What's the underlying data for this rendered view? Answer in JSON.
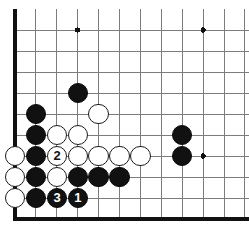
{
  "diagram": {
    "board": {
      "kind": "go-board",
      "orientation": "lower-left-corner",
      "grid_cols": 11,
      "grid_rows": 10,
      "origin_x": 15,
      "origin_y_bottom": 219,
      "spacing_x": 20.9,
      "spacing_y": 21.0,
      "stone_radius": 10.2,
      "line_color": "#7c7c7c",
      "edge_color": "#111111",
      "edge_width": 3.2,
      "line_width": 1.0,
      "background_color": "#ffffff",
      "black_color": "#111111",
      "white_color": "#ffffff",
      "white_outline_color": "#1a1a1a",
      "star_points": [
        {
          "col": 4,
          "row": 10
        },
        {
          "col": 10,
          "row": 10
        },
        {
          "col": 10,
          "row": 4
        }
      ]
    },
    "stones": [
      {
        "id": "b-c4r7",
        "color": "black",
        "col": 4,
        "row": 7,
        "label": ""
      },
      {
        "id": "b-c2r6",
        "color": "black",
        "col": 2,
        "row": 6,
        "label": ""
      },
      {
        "id": "b-c2r5",
        "color": "black",
        "col": 2,
        "row": 5,
        "label": ""
      },
      {
        "id": "w-c5r6",
        "color": "white",
        "col": 5,
        "row": 6,
        "label": ""
      },
      {
        "id": "w-c3r5",
        "color": "white",
        "col": 3,
        "row": 5,
        "label": ""
      },
      {
        "id": "w-c4r5",
        "color": "white",
        "col": 4,
        "row": 5,
        "label": ""
      },
      {
        "id": "b-c9r5",
        "color": "black",
        "col": 9,
        "row": 5,
        "label": ""
      },
      {
        "id": "w-c1r4",
        "color": "white",
        "col": 1,
        "row": 4,
        "label": ""
      },
      {
        "id": "b-c2r4",
        "color": "black",
        "col": 2,
        "row": 4,
        "label": ""
      },
      {
        "id": "w-c3r4",
        "color": "white",
        "col": 3,
        "row": 4,
        "label": "2"
      },
      {
        "id": "w-c4r4",
        "color": "white",
        "col": 4,
        "row": 4,
        "label": ""
      },
      {
        "id": "w-c5r4",
        "color": "white",
        "col": 5,
        "row": 4,
        "label": ""
      },
      {
        "id": "w-c6r4",
        "color": "white",
        "col": 6,
        "row": 4,
        "label": ""
      },
      {
        "id": "w-c7r4",
        "color": "white",
        "col": 7,
        "row": 4,
        "label": ""
      },
      {
        "id": "b-c9r4",
        "color": "black",
        "col": 9,
        "row": 4,
        "label": ""
      },
      {
        "id": "w-c1r3",
        "color": "white",
        "col": 1,
        "row": 3,
        "label": ""
      },
      {
        "id": "b-c2r3",
        "color": "black",
        "col": 2,
        "row": 3,
        "label": ""
      },
      {
        "id": "w-c3r3",
        "color": "white",
        "col": 3,
        "row": 3,
        "label": ""
      },
      {
        "id": "b-c4r3",
        "color": "black",
        "col": 4,
        "row": 3,
        "label": ""
      },
      {
        "id": "b-c5r3",
        "color": "black",
        "col": 5,
        "row": 3,
        "label": ""
      },
      {
        "id": "b-c6r3",
        "color": "black",
        "col": 6,
        "row": 3,
        "label": ""
      },
      {
        "id": "w-c1r2",
        "color": "white",
        "col": 1,
        "row": 2,
        "label": ""
      },
      {
        "id": "b-c2r2",
        "color": "black",
        "col": 2,
        "row": 2,
        "label": ""
      },
      {
        "id": "b-c3r2",
        "color": "black",
        "col": 3,
        "row": 2,
        "label": "3"
      },
      {
        "id": "b-c4r2",
        "color": "black",
        "col": 4,
        "row": 2,
        "label": "1"
      }
    ],
    "move_labels": [
      "1",
      "2",
      "3"
    ]
  }
}
